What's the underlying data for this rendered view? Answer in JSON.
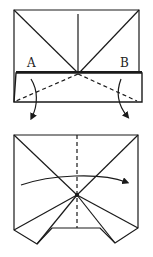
{
  "figure": {
    "title": "",
    "steps": [
      {
        "id": "step-1",
        "labels": [
          {
            "text": "A",
            "x": 30,
            "y": 67
          },
          {
            "text": "B",
            "x": 123,
            "y": 67
          }
        ],
        "description": "Rectangle with diagonal creases from top corners meeting at center; bottom band folded up; dashed valley lines A and B; arrows indicate folding down"
      },
      {
        "id": "step-2",
        "labels": [],
        "description": "Result with two triangular flaps at bottom; vertical dashed center line; curved arrow indicates folding left half over to the right"
      }
    ],
    "colors": {
      "line": "#1a1a1a",
      "background": "#ffffff"
    }
  }
}
